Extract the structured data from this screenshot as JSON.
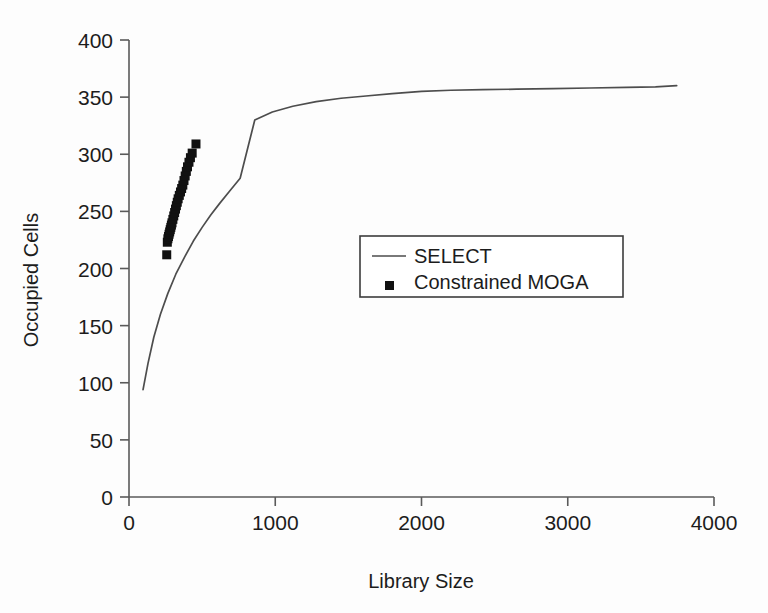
{
  "chart_data": {
    "type": "scatter",
    "title": "",
    "xlabel": "Library Size",
    "ylabel": "Occupied Cells",
    "xlim": [
      0,
      4000
    ],
    "ylim": [
      0,
      400
    ],
    "xticks": [
      0,
      1000,
      2000,
      3000,
      4000
    ],
    "yticks": [
      0,
      50,
      100,
      150,
      200,
      250,
      300,
      350,
      400
    ],
    "xtick_labels": [
      "0",
      "1000",
      "2000",
      "3000",
      "4000"
    ],
    "ytick_labels": [
      "0",
      "50",
      "100",
      "150",
      "200",
      "250",
      "300",
      "350",
      "400"
    ],
    "grid": false,
    "legend_position": "center",
    "series": [
      {
        "name": "SELECT",
        "type": "line",
        "color": "#4d4d4d",
        "x": [
          96,
          130,
          170,
          215,
          265,
          320,
          380,
          440,
          500,
          560,
          620,
          690,
          760,
          860,
          980,
          1120,
          1280,
          1450,
          1620,
          1800,
          2000,
          2200,
          2420,
          2650,
          2900,
          3150,
          3400,
          3600,
          3745
        ],
        "y": [
          94,
          117,
          140,
          160,
          178,
          195,
          210,
          224,
          236,
          247,
          257,
          268,
          279,
          330,
          337,
          342,
          346,
          349,
          351,
          353,
          355,
          356,
          356.5,
          357,
          357.5,
          358,
          358.5,
          359,
          360
        ]
      },
      {
        "name": "Constrained MOGA",
        "type": "scatter",
        "color": "#111111",
        "marker": "square",
        "x": [
          258,
          262,
          266,
          270,
          274,
          278,
          282,
          286,
          290,
          294,
          300,
          306,
          312,
          318,
          324,
          330,
          336,
          344,
          352,
          360,
          368,
          376,
          384,
          392,
          400,
          410,
          420,
          432,
          458
        ],
        "y": [
          212,
          223,
          226,
          228,
          230,
          232,
          234,
          236,
          238,
          240,
          243,
          246,
          249,
          252,
          255,
          258,
          261,
          264,
          267,
          270,
          273,
          277,
          281,
          285,
          289,
          293,
          297,
          301,
          309
        ]
      }
    ],
    "legend_entries": [
      {
        "label": "SELECT",
        "marker": "line"
      },
      {
        "label": "Constrained MOGA",
        "marker": "square"
      }
    ]
  }
}
